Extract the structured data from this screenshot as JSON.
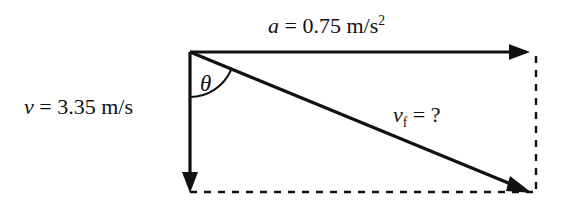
{
  "figure": {
    "type": "vector-addition-diagram",
    "background_color": "#ffffff",
    "stroke_color": "#111111"
  },
  "labels": {
    "acceleration": {
      "symbol": "a",
      "equals": " = ",
      "value": "0.75",
      "unit": "m/s",
      "unit_exponent": "2",
      "full_text": "a = 0.75 m/s2"
    },
    "velocity": {
      "symbol": "v",
      "equals": " = ",
      "value": "3.35",
      "unit": "m/s",
      "full_text": "v = 3.35 m/s"
    },
    "final_velocity": {
      "symbol": "v",
      "subscript": "f",
      "equals": " = ",
      "value": "?",
      "full_text": "vf = ?"
    },
    "angle": {
      "symbol": "θ",
      "name": "theta"
    }
  },
  "vectors": [
    {
      "name": "acceleration-vector",
      "label": "a = 0.75 m/s2",
      "direction": "right",
      "style": "solid",
      "from": [
        190,
        52
      ],
      "to": [
        530,
        52
      ]
    },
    {
      "name": "velocity-vector",
      "label": "v = 3.35 m/s",
      "direction": "down",
      "style": "solid",
      "from": [
        190,
        52
      ],
      "to": [
        190,
        192
      ]
    },
    {
      "name": "resultant-vector",
      "label": "vf = ?",
      "direction": "down-right",
      "style": "solid",
      "from": [
        190,
        52
      ],
      "to": [
        530,
        192
      ]
    }
  ],
  "construction_lines": [
    {
      "name": "bottom-dashed-line",
      "style": "dashed",
      "from": [
        190,
        192
      ],
      "to": [
        536,
        192
      ]
    },
    {
      "name": "right-dashed-line",
      "style": "dashed",
      "from": [
        536,
        56
      ],
      "to": [
        536,
        192
      ]
    }
  ]
}
